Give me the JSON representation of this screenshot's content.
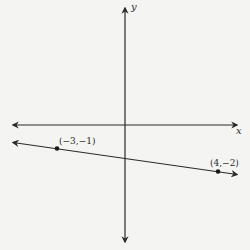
{
  "diagram": {
    "type": "coordinate-plane",
    "background_color": "#f4f4f2",
    "stroke_color": "#2a2a2a",
    "axes": {
      "x_label": "x",
      "y_label": "y"
    },
    "line": {
      "description": "straight line through two labeled points, extending both directions",
      "points": [
        {
          "label": "(−3,−1)",
          "x": -3,
          "y": -1
        },
        {
          "label": "(4,−2)",
          "x": 4,
          "y": -2
        }
      ]
    }
  }
}
